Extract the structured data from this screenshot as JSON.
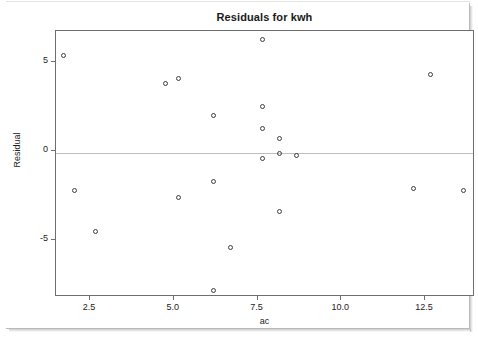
{
  "chart_data": {
    "type": "scatter",
    "title": "Residuals for kwh",
    "xlabel": "ac",
    "ylabel": "Residual",
    "xlim": [
      1.0,
      14.1
    ],
    "ylim": [
      -8.4,
      7.0
    ],
    "xticks": [
      "2.5",
      "5.0",
      "7.5",
      "10.0",
      "12.5"
    ],
    "xtick_values": [
      2.5,
      5.0,
      7.5,
      10.0,
      12.5
    ],
    "yticks": [
      "5",
      "0",
      "-5"
    ],
    "ytick_values": [
      5,
      0,
      -5
    ],
    "grid": false,
    "legend": null,
    "reference_line": {
      "y": 0,
      "color": "#bdbdbd"
    },
    "marker": {
      "shape": "open-circle",
      "color": "#3d3d3d",
      "size": 5
    },
    "x": [
      1.55,
      1.9,
      2.5,
      4.6,
      5.0,
      5.0,
      6.05,
      6.05,
      6.05,
      6.55,
      7.5,
      7.5,
      7.5,
      7.5,
      8.0,
      8.0,
      8.0,
      8.5,
      12.0,
      12.5,
      13.5
    ],
    "y": [
      5.5,
      -2.1,
      -4.4,
      3.9,
      4.2,
      -2.5,
      2.1,
      -1.6,
      -7.7,
      -5.3,
      6.4,
      2.6,
      1.4,
      -0.3,
      0.8,
      0.0,
      -3.3,
      -0.15,
      -2.0,
      4.4,
      -2.1
    ],
    "points": [
      {
        "ac": 1.55,
        "residual": 5.5
      },
      {
        "ac": 1.9,
        "residual": -2.1
      },
      {
        "ac": 2.5,
        "residual": -4.4
      },
      {
        "ac": 4.6,
        "residual": 3.9
      },
      {
        "ac": 5.0,
        "residual": 4.2
      },
      {
        "ac": 5.0,
        "residual": -2.5
      },
      {
        "ac": 6.05,
        "residual": 2.1
      },
      {
        "ac": 6.05,
        "residual": -1.6
      },
      {
        "ac": 6.05,
        "residual": -7.7
      },
      {
        "ac": 6.55,
        "residual": -5.3
      },
      {
        "ac": 7.5,
        "residual": 6.4
      },
      {
        "ac": 7.5,
        "residual": 2.6
      },
      {
        "ac": 7.5,
        "residual": 1.4
      },
      {
        "ac": 7.5,
        "residual": -0.3
      },
      {
        "ac": 8.0,
        "residual": 0.8
      },
      {
        "ac": 8.0,
        "residual": 0.0
      },
      {
        "ac": 8.0,
        "residual": -3.3
      },
      {
        "ac": 8.5,
        "residual": -0.15
      },
      {
        "ac": 12.0,
        "residual": -2.0
      },
      {
        "ac": 12.5,
        "residual": 4.4
      },
      {
        "ac": 13.5,
        "residual": -2.1
      }
    ]
  },
  "colors": {
    "frame": "#6e6e6e",
    "marker": "#3d3d3d",
    "zero_line": "#bdbdbd",
    "text": "#222222",
    "background": "#ffffff"
  }
}
